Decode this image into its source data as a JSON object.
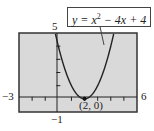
{
  "chart_data": {
    "type": "line",
    "title": "",
    "equation": "y = x^2 - 4x + 4",
    "xlabel": "",
    "ylabel": "",
    "xlim": [
      -3,
      6
    ],
    "ylim": [
      -1,
      5
    ],
    "x": [
      -3,
      -2,
      -1,
      0,
      1,
      2,
      3,
      4,
      5,
      6
    ],
    "series": [
      {
        "name": "y = x^2 - 4x + 4",
        "values": [
          25,
          16,
          9,
          4,
          1,
          0,
          1,
          4,
          9,
          16
        ]
      }
    ],
    "annotations": [
      {
        "text": "(2, 0)",
        "x": 2,
        "y": 0
      }
    ],
    "grid": false,
    "legend": "callout box top-right"
  },
  "labels": {
    "xmin": "−3",
    "xmax": "6",
    "ymin": "−1",
    "ymax": "5",
    "vertex": "(2, 0)",
    "eq_prefix": "y = x",
    "eq_exp": "2",
    "eq_suffix": " − 4x + 4"
  },
  "colors": {
    "screen_bg": "#d9d9d9",
    "frame": "#333333",
    "curve": "#222222"
  }
}
